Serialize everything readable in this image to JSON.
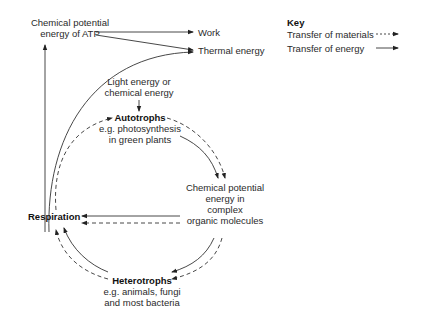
{
  "diagram": {
    "nodes": {
      "atp": {
        "line1": "Chemical potential",
        "line2": "energy of ATP"
      },
      "work": "Work",
      "thermal": "Thermal energy",
      "light": {
        "line1": "Light energy or",
        "line2": "chemical energy"
      },
      "autotrophs": {
        "title": "Autotrophs",
        "line1": "e.g. photosynthesis",
        "line2": "in green plants"
      },
      "organic": {
        "line1": "Chemical potential",
        "line2": "energy in",
        "line3": "complex",
        "line4": "organic molecules"
      },
      "respiration": "Respiration",
      "heterotrophs": {
        "title": "Heterotrophs",
        "line1": "e.g. animals, fungi",
        "line2": "and most bacteria"
      }
    },
    "key": {
      "title": "Key",
      "materials": "Transfer of materials",
      "energy": "Transfer of energy"
    },
    "edges": [
      {
        "from": "atp",
        "to": "work",
        "type": "energy"
      },
      {
        "from": "atp",
        "to": "thermal",
        "type": "energy"
      },
      {
        "from": "respiration",
        "to": "atp",
        "type": "energy"
      },
      {
        "from": "respiration",
        "to": "thermal",
        "type": "energy"
      },
      {
        "from": "light",
        "to": "autotrophs",
        "type": "energy"
      },
      {
        "from": "autotrophs",
        "to": "organic",
        "type": "energy"
      },
      {
        "from": "autotrophs",
        "to": "organic",
        "type": "materials"
      },
      {
        "from": "organic",
        "to": "respiration",
        "type": "energy"
      },
      {
        "from": "organic",
        "to": "respiration",
        "type": "materials"
      },
      {
        "from": "organic",
        "to": "heterotrophs",
        "type": "energy"
      },
      {
        "from": "organic",
        "to": "heterotrophs",
        "type": "materials"
      },
      {
        "from": "heterotrophs",
        "to": "respiration",
        "type": "energy"
      },
      {
        "from": "heterotrophs",
        "to": "respiration",
        "type": "materials"
      },
      {
        "from": "respiration",
        "to": "autotrophs",
        "type": "materials"
      }
    ]
  }
}
